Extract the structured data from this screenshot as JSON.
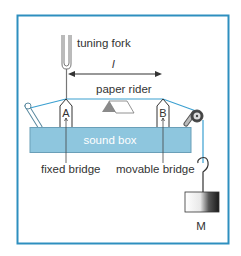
{
  "diagram": {
    "labels": {
      "tuning_fork": "tuning fork",
      "length": "l",
      "paper_rider": "paper rider",
      "bridge_a": "A",
      "bridge_b": "B",
      "sound_box": "sound box",
      "fixed_bridge": "fixed bridge",
      "movable_bridge": "movable bridge",
      "mass": "M"
    },
    "colors": {
      "frame": "#2e8fbf",
      "wire": "#3a9fd0",
      "sound_box_fill": "#8ec6de",
      "sound_box_stroke": "#6a9fb8",
      "rider_gray": "#8a8a8a",
      "text": "#333333"
    }
  }
}
